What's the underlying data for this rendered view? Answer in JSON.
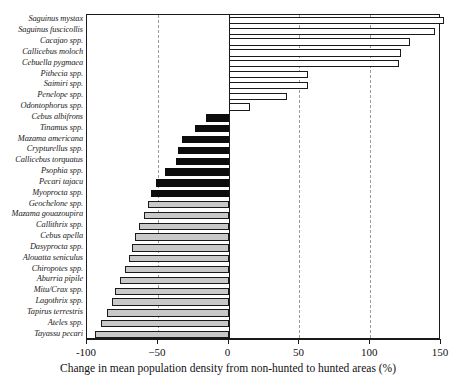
{
  "chart_data": {
    "type": "bar",
    "orientation": "horizontal",
    "title": "",
    "xlabel": "Change in mean population density from non-hunted to hunted areas (%)",
    "ylabel": "",
    "xlim": [
      -100,
      150
    ],
    "xticks": [
      -100,
      -50,
      0,
      50,
      100,
      150
    ],
    "xticklabels": [
      "-100",
      "−50",
      "0",
      "50",
      "100",
      "150"
    ],
    "gridlines_at": [
      -50,
      50,
      100
    ],
    "grid": true,
    "legend_position": "none",
    "zero_reference_line": 0,
    "categories": [
      "Saguinus mystax",
      "Saguinus fuscicollis",
      "Cacajao spp.",
      "Callicebus moloch",
      "Cebuella pygmaea",
      "Pithecia spp.",
      "Saimiri spp.",
      "Penelope spp.",
      "Odontophorus spp.",
      "Cebus albifrons",
      "Tinamus spp.",
      "Mazama americana",
      "Crypturellus spp.",
      "Callicebus torquatus",
      "Psophia spp.",
      "Pecari tajacu",
      "Myoprocta spp.",
      "Geochelone spp.",
      "Mazama gouazoupira",
      "Callithrix spp.",
      "Cebus apella",
      "Dasyprocta spp.",
      "Alouatta seniculus",
      "Chiropotes spp.",
      "Aburria pipile",
      "Mitu/Crax spp.",
      "Lagothrix spp.",
      "Tapirus terrestris",
      "Ateles spp.",
      "Tayassu pecari"
    ],
    "values": [
      152,
      146,
      128,
      122,
      120,
      56,
      56,
      41,
      15,
      -16,
      -24,
      -33,
      -36,
      -37,
      -45,
      -51,
      -55,
      -57,
      -60,
      -63,
      -66,
      -68,
      -70,
      -73,
      -77,
      -80,
      -82,
      -86,
      -90,
      -94
    ],
    "series": [
      {
        "name": "Change in mean population density (%)",
        "values": [
          152,
          146,
          128,
          122,
          120,
          56,
          56,
          41,
          15,
          -16,
          -24,
          -33,
          -36,
          -37,
          -45,
          -51,
          -55,
          -57,
          -60,
          -63,
          -66,
          -68,
          -70,
          -73,
          -77,
          -80,
          -82,
          -86,
          -90,
          -94
        ]
      }
    ],
    "bar_styles": [
      "pos",
      "pos",
      "pos",
      "pos",
      "pos",
      "pos",
      "pos",
      "pos",
      "pos",
      "neg-dark",
      "neg-dark",
      "neg-dark",
      "neg-dark",
      "neg-dark",
      "neg-dark",
      "neg-dark",
      "neg-dark",
      "neg-gray",
      "neg-gray",
      "neg-gray",
      "neg-gray",
      "neg-gray",
      "neg-gray",
      "neg-gray",
      "neg-gray",
      "neg-gray",
      "neg-gray",
      "neg-gray",
      "neg-gray",
      "neg-gray"
    ],
    "colors": {
      "positive_fill": "#ffffff",
      "negative_dark_fill": "#0d0d0d",
      "negative_gray_fill": "#c9c9c9",
      "outline": "#1a1a1a",
      "gridline": "#9a9a9a"
    }
  }
}
